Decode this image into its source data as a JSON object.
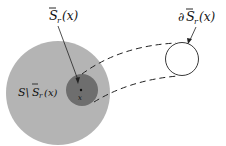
{
  "diagram": {
    "labels": {
      "s_bar": "S",
      "s_bar_sub": "r",
      "s_bar_arg": "(x)",
      "boundary_prefix": "∂",
      "boundary_s": "S",
      "boundary_sub": "r",
      "boundary_arg": "(x)",
      "complement_s": "S\\",
      "complement_sbar": "S",
      "complement_sub": "r",
      "complement_arg": "(x)",
      "point": "x"
    },
    "colors": {
      "outer_region": "#b4b4b4",
      "inner_ball": "#6e6e6e",
      "boundary_circle": "#ffffff",
      "stroke": "#222222"
    }
  }
}
